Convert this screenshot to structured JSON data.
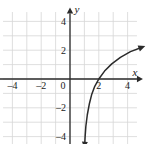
{
  "chart_data": {
    "type": "line",
    "title": "",
    "xlabel": "x",
    "ylabel": "y",
    "xlim": [
      -5,
      5
    ],
    "ylim": [
      -5,
      5
    ],
    "grid": true,
    "grid_step": 1,
    "legend": null,
    "x_ticks": [
      -4,
      -2,
      0,
      2,
      4
    ],
    "x_tick_labels": [
      "-4",
      "-2",
      "0",
      "2",
      "4"
    ],
    "y_ticks": [
      -4,
      -2,
      2,
      4
    ],
    "y_tick_labels": [
      "-4",
      "-2",
      "2",
      "4"
    ],
    "origin_label": "0",
    "series": [
      {
        "name": "logarithmic-curve",
        "vertical_asymptote": 1,
        "x_intercept": 2,
        "arrow_start": "down",
        "arrow_end": "up-right",
        "points": [
          [
            1.02,
            -4.6
          ],
          [
            1.05,
            -4.0
          ],
          [
            1.1,
            -3.3
          ],
          [
            1.2,
            -2.5
          ],
          [
            1.35,
            -1.7
          ],
          [
            1.5,
            -1.1
          ],
          [
            1.7,
            -0.55
          ],
          [
            2.0,
            0.0
          ],
          [
            2.4,
            0.55
          ],
          [
            2.9,
            1.05
          ],
          [
            3.5,
            1.5
          ],
          [
            4.2,
            1.9
          ],
          [
            5.0,
            2.2
          ]
        ]
      }
    ]
  },
  "style": {
    "grid_color": "#d6d6d6",
    "axis_color": "#2b2b2b",
    "curve_color": "#2b2b2b",
    "background": "#ffffff"
  },
  "axis_labels": {
    "x": "x",
    "y": "y"
  }
}
